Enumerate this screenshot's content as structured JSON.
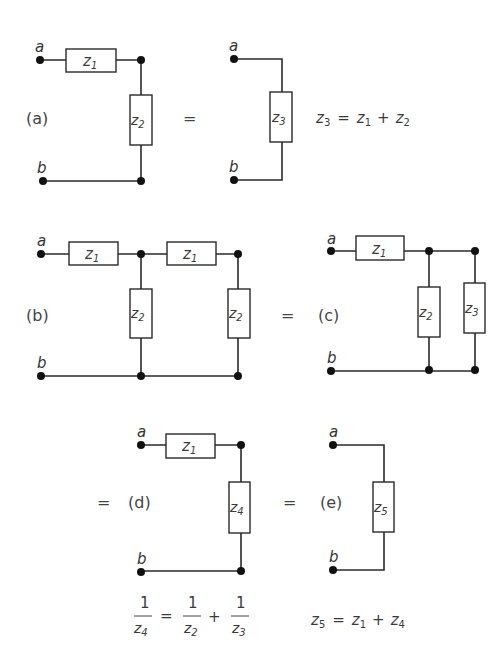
{
  "diagram": {
    "type": "impedance-network-reduction",
    "panels": [
      {
        "id": "a",
        "label": "(a)",
        "terminals": [
          "a",
          "b"
        ],
        "components": [
          {
            "name": "z",
            "sub": "1",
            "orientation": "series"
          },
          {
            "name": "z",
            "sub": "2",
            "orientation": "shunt"
          }
        ]
      },
      {
        "id": "a-equiv",
        "terminals": [
          "a",
          "b"
        ],
        "components": [
          {
            "name": "z",
            "sub": "3",
            "orientation": "shunt"
          }
        ],
        "equation": {
          "lhs": "z3",
          "rhs": "z1 + z2"
        }
      },
      {
        "id": "b",
        "label": "(b)",
        "terminals": [
          "a",
          "b"
        ],
        "components": [
          {
            "name": "z",
            "sub": "1"
          },
          {
            "name": "z",
            "sub": "2"
          },
          {
            "name": "z",
            "sub": "1"
          },
          {
            "name": "z",
            "sub": "2"
          }
        ]
      },
      {
        "id": "c",
        "label": "(c)",
        "terminals": [
          "a",
          "b"
        ],
        "components": [
          {
            "name": "z",
            "sub": "1"
          },
          {
            "name": "z",
            "sub": "2"
          },
          {
            "name": "z",
            "sub": "3"
          }
        ]
      },
      {
        "id": "d",
        "label": "(d)",
        "terminals": [
          "a",
          "b"
        ],
        "components": [
          {
            "name": "z",
            "sub": "1"
          },
          {
            "name": "z",
            "sub": "4"
          }
        ],
        "equation": {
          "lhs": "1/z4",
          "rhs": "1/z2 + 1/z3"
        }
      },
      {
        "id": "e",
        "label": "(e)",
        "terminals": [
          "a",
          "b"
        ],
        "components": [
          {
            "name": "z",
            "sub": "5"
          }
        ],
        "equation": {
          "lhs": "z5",
          "rhs": "z1 + z4"
        }
      }
    ]
  },
  "labels": {
    "a": "(a)",
    "b": "(b)",
    "c": "(c)",
    "d": "(d)",
    "e": "(e)",
    "equals": "=",
    "plus": "+",
    "terminal_a": "a",
    "terminal_b": "b",
    "z": "z",
    "one": "1",
    "s1": "1",
    "s2": "2",
    "s3": "3",
    "s4": "4",
    "s5": "5"
  }
}
